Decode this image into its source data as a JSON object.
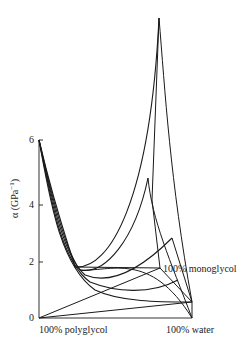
{
  "chart_data": {
    "type": "line",
    "title": "",
    "ylabel": "α (GPa⁻¹)",
    "ylabel_prefix": "α (GPa",
    "ylabel_sup": "−1",
    "ylabel_suffix": ")",
    "yticks": [
      "0",
      "2",
      "4",
      "6"
    ],
    "ylim": [
      0,
      10
    ],
    "base_labels": {
      "left": "100% polyglycol",
      "right": "100% water",
      "back": "100% monoglycol"
    },
    "series": [
      {
        "name": "curve-1",
        "start_alpha": 6.0,
        "min_alpha": 0.5,
        "end_alpha": 0.5
      },
      {
        "name": "curve-2",
        "start_alpha": 6.0,
        "min_alpha": 0.8,
        "end_alpha": 1.5
      },
      {
        "name": "curve-3",
        "start_alpha": 6.0,
        "min_alpha": 1.1,
        "end_alpha": 3.0
      },
      {
        "name": "curve-4",
        "start_alpha": 6.0,
        "min_alpha": 1.3,
        "end_alpha": 5.5
      },
      {
        "name": "curve-5",
        "start_alpha": 6.0,
        "min_alpha": 1.5,
        "end_alpha": 10.0
      }
    ],
    "colors": {
      "line": "#1a1a1a",
      "axis": "#333333",
      "text": "#222222"
    }
  },
  "svg": {
    "axis_path": "M39 140 L39 318 L192 318",
    "base_paths": [
      "M39 318 L192 302",
      "M39 318 L160 268",
      "M192 302 L192 318",
      "M160 268 L192 302"
    ],
    "curve_paths": [
      "M39 140 C50 200, 60 265, 95 290 C120 302, 160 302, 192 302",
      "M39 140 C52 205, 62 262, 90 282 C115 292, 150 295, 178 280",
      "M39 140 C54 210, 65 258, 85 275 C110 285, 140 270, 172 238",
      "M39 140 C56 215, 68 254, 80 270 C105 275, 135 240, 148 178",
      "M39 140 C58 220, 70 248, 75 267 C110 270, 150 200, 159 18"
    ],
    "cross_paths": [
      "M159 18 C165 90, 170 180, 192 302",
      "M159 18 L152 200 L160 268",
      "M148 178 C152 220, 170 260, 192 318",
      "M172 238 L192 302",
      "M75 267 L160 268",
      "M80 270 C110 272, 150 250, 192 318"
    ]
  }
}
